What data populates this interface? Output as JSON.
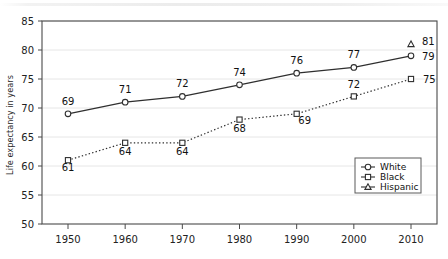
{
  "chart_data": {
    "type": "line",
    "title": "",
    "subtitle": "",
    "xlabel": "",
    "ylabel": "Life expectancy in years",
    "categories": [
      1950,
      1960,
      1970,
      1980,
      1990,
      2000,
      2010
    ],
    "xticklabels": [
      "1950",
      "1960",
      "1970",
      "1980",
      "1990",
      "2000",
      "2010"
    ],
    "yticks": [
      50,
      55,
      60,
      65,
      70,
      75,
      80,
      85
    ],
    "yticklabels": [
      "50",
      "55",
      "60",
      "65",
      "70",
      "75",
      "80",
      "85"
    ],
    "ylim": [
      50,
      85
    ],
    "xlim": [
      1945,
      2015
    ],
    "grid": "horizontal",
    "legend_position": "inside-lower-right",
    "series": [
      {
        "name": "White",
        "marker": "circle-open",
        "linestyle": "solid",
        "color": "#333333",
        "x": [
          1950,
          1960,
          1970,
          1980,
          1990,
          2000,
          2010
        ],
        "values": [
          69,
          71,
          72,
          74,
          76,
          77,
          79
        ],
        "labels": [
          "69",
          "71",
          "72",
          "74",
          "76",
          "77",
          "79"
        ]
      },
      {
        "name": "Black",
        "marker": "square-open",
        "linestyle": "dotted",
        "color": "#333333",
        "x": [
          1950,
          1960,
          1970,
          1980,
          1990,
          2000,
          2010
        ],
        "values": [
          61,
          64,
          64,
          68,
          69,
          72,
          75
        ],
        "labels": [
          "61",
          "64",
          "64",
          "68",
          "69",
          "72",
          "75"
        ]
      },
      {
        "name": "Hispanic",
        "marker": "triangle-open",
        "linestyle": "none",
        "color": "#333333",
        "x": [
          2010
        ],
        "values": [
          81
        ],
        "labels": [
          "81"
        ]
      }
    ]
  },
  "legend": {
    "items": [
      {
        "label": "White",
        "marker": "circle-open"
      },
      {
        "label": "Black",
        "marker": "square-open"
      },
      {
        "label": "Hispanic",
        "marker": "triangle-open"
      }
    ]
  },
  "colors": {
    "axis": "#4a4a4a",
    "grid": "#e6e6e6",
    "series": "#2f2f2f",
    "text": "#111111",
    "background": "#ffffff"
  }
}
